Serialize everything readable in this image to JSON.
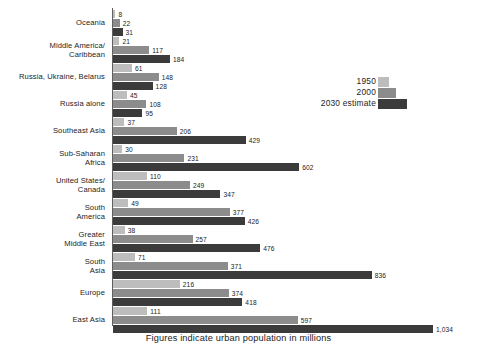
{
  "caption": "Figures indicate urban population in millions",
  "legend": {
    "items": [
      {
        "label": "1950",
        "series_key": "s1950",
        "color": "#bdbdbd"
      },
      {
        "label": "2000",
        "series_key": "s2000",
        "color": "#8c8c8c"
      },
      {
        "label": "2030 estimate",
        "series_key": "s2030",
        "color": "#3b3b3b"
      }
    ]
  },
  "chart_data": {
    "type": "bar",
    "orientation": "horizontal",
    "title": "",
    "subtitle": "",
    "xlabel": "",
    "ylabel": "",
    "annotations": [
      "Figures indicate urban population in millions"
    ],
    "legend_position": "right-upper",
    "grid": false,
    "xlim": [
      0,
      1034
    ],
    "value_unit": "millions",
    "categories": [
      "Oceania",
      "Middle America/\nCaribbean",
      "Russia, Ukraine, Belarus",
      "Russia alone",
      "Southeast Asia",
      "Sub-Saharan\nAfrica",
      "United States/\nCanada",
      "South\nAmerica",
      "Greater\nMiddle East",
      "South\nAsia",
      "Europe",
      "East Asia"
    ],
    "series": [
      {
        "name": "1950",
        "color": "#bdbdbd",
        "values": [
          8,
          21,
          61,
          45,
          37,
          30,
          110,
          49,
          38,
          71,
          216,
          111
        ],
        "labels": [
          "8",
          "21",
          "61",
          "45",
          "37",
          "30",
          "110",
          "49",
          "38",
          "71",
          "216",
          "111"
        ]
      },
      {
        "name": "2000",
        "color": "#8c8c8c",
        "values": [
          22,
          117,
          148,
          108,
          206,
          231,
          249,
          377,
          257,
          371,
          374,
          597
        ],
        "labels": [
          "22",
          "117",
          "148",
          "108",
          "206",
          "231",
          "249",
          "377",
          "257",
          "371",
          "374",
          "597"
        ]
      },
      {
        "name": "2030 estimate",
        "color": "#3b3b3b",
        "values": [
          31,
          184,
          128,
          95,
          429,
          602,
          347,
          426,
          476,
          836,
          418,
          1034
        ],
        "labels": [
          "31",
          "184",
          "128",
          "95",
          "429",
          "602",
          "347",
          "426",
          "476",
          "836",
          "418",
          "1,034"
        ]
      }
    ]
  },
  "rows": [
    {
      "label": "Oceania",
      "label_lines": [
        "Oceania"
      ],
      "bars": [
        {
          "series": "1950",
          "key": "s1950",
          "value": 8,
          "label": "8"
        },
        {
          "series": "2000",
          "key": "s2000",
          "value": 22,
          "label": "22"
        },
        {
          "series": "2030 estimate",
          "key": "s2030",
          "value": 31,
          "label": "31"
        }
      ]
    },
    {
      "label": "Middle America/ Caribbean",
      "label_lines": [
        "Middle America/",
        "Caribbean"
      ],
      "bars": [
        {
          "series": "1950",
          "key": "s1950",
          "value": 21,
          "label": "21"
        },
        {
          "series": "2000",
          "key": "s2000",
          "value": 117,
          "label": "117"
        },
        {
          "series": "2030 estimate",
          "key": "s2030",
          "value": 184,
          "label": "184"
        }
      ]
    },
    {
      "label": "Russia, Ukraine, Belarus",
      "label_lines": [
        "Russia, Ukraine, Belarus"
      ],
      "bars": [
        {
          "series": "1950",
          "key": "s1950",
          "value": 61,
          "label": "61"
        },
        {
          "series": "2000",
          "key": "s2000",
          "value": 148,
          "label": "148"
        },
        {
          "series": "2030 estimate",
          "key": "s2030",
          "value": 128,
          "label": "128"
        }
      ]
    },
    {
      "label": "Russia alone",
      "label_lines": [
        "Russia alone"
      ],
      "bars": [
        {
          "series": "1950",
          "key": "s1950",
          "value": 45,
          "label": "45"
        },
        {
          "series": "2000",
          "key": "s2000",
          "value": 108,
          "label": "108"
        },
        {
          "series": "2030 estimate",
          "key": "s2030",
          "value": 95,
          "label": "95"
        }
      ]
    },
    {
      "label": "Southeast Asia",
      "label_lines": [
        "Southeast Asia"
      ],
      "bars": [
        {
          "series": "1950",
          "key": "s1950",
          "value": 37,
          "label": "37"
        },
        {
          "series": "2000",
          "key": "s2000",
          "value": 206,
          "label": "206"
        },
        {
          "series": "2030 estimate",
          "key": "s2030",
          "value": 429,
          "label": "429"
        }
      ]
    },
    {
      "label": "Sub-Saharan Africa",
      "label_lines": [
        "Sub-Saharan",
        "Africa"
      ],
      "bars": [
        {
          "series": "1950",
          "key": "s1950",
          "value": 30,
          "label": "30"
        },
        {
          "series": "2000",
          "key": "s2000",
          "value": 231,
          "label": "231"
        },
        {
          "series": "2030 estimate",
          "key": "s2030",
          "value": 602,
          "label": "602"
        }
      ]
    },
    {
      "label": "United States/ Canada",
      "label_lines": [
        "United States/",
        "Canada"
      ],
      "bars": [
        {
          "series": "1950",
          "key": "s1950",
          "value": 110,
          "label": "110"
        },
        {
          "series": "2000",
          "key": "s2000",
          "value": 249,
          "label": "249"
        },
        {
          "series": "2030 estimate",
          "key": "s2030",
          "value": 347,
          "label": "347"
        }
      ]
    },
    {
      "label": "South America",
      "label_lines": [
        "South",
        "America"
      ],
      "bars": [
        {
          "series": "1950",
          "key": "s1950",
          "value": 49,
          "label": "49"
        },
        {
          "series": "2000",
          "key": "s2000",
          "value": 377,
          "label": "377"
        },
        {
          "series": "2030 estimate",
          "key": "s2030",
          "value": 426,
          "label": "426"
        }
      ]
    },
    {
      "label": "Greater Middle East",
      "label_lines": [
        "Greater",
        "Middle East"
      ],
      "bars": [
        {
          "series": "1950",
          "key": "s1950",
          "value": 38,
          "label": "38"
        },
        {
          "series": "2000",
          "key": "s2000",
          "value": 257,
          "label": "257"
        },
        {
          "series": "2030 estimate",
          "key": "s2030",
          "value": 476,
          "label": "476"
        }
      ]
    },
    {
      "label": "South Asia",
      "label_lines": [
        "South",
        "Asia"
      ],
      "bars": [
        {
          "series": "1950",
          "key": "s1950",
          "value": 71,
          "label": "71"
        },
        {
          "series": "2000",
          "key": "s2000",
          "value": 371,
          "label": "371"
        },
        {
          "series": "2030 estimate",
          "key": "s2030",
          "value": 836,
          "label": "836"
        }
      ]
    },
    {
      "label": "Europe",
      "label_lines": [
        "Europe"
      ],
      "bars": [
        {
          "series": "1950",
          "key": "s1950",
          "value": 216,
          "label": "216"
        },
        {
          "series": "2000",
          "key": "s2000",
          "value": 374,
          "label": "374"
        },
        {
          "series": "2030 estimate",
          "key": "s2030",
          "value": 418,
          "label": "418"
        }
      ]
    },
    {
      "label": "East Asia",
      "label_lines": [
        "East Asia"
      ],
      "bars": [
        {
          "series": "1950",
          "key": "s1950",
          "value": 111,
          "label": "111"
        },
        {
          "series": "2000",
          "key": "s2000",
          "value": 597,
          "label": "597"
        },
        {
          "series": "2030 estimate",
          "key": "s2030",
          "value": 1034,
          "label": "1,034"
        }
      ]
    }
  ]
}
